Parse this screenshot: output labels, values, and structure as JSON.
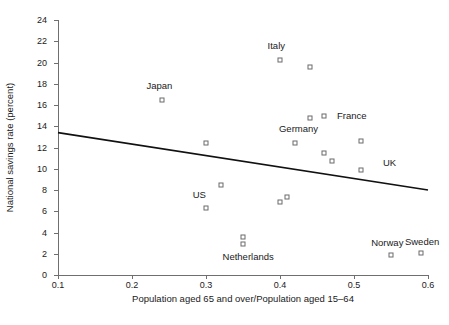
{
  "chart_data": {
    "type": "scatter",
    "title": "",
    "xlabel": "Population aged 65 and over/Population aged 15–64",
    "ylabel": "National savings rate (percent)",
    "xlim": [
      0.1,
      0.6
    ],
    "ylim": [
      0,
      24
    ],
    "xticks": [
      0.1,
      0.2,
      0.3,
      0.4,
      0.5,
      0.6
    ],
    "xtick_labels": [
      "0.1",
      "0.2",
      "0.3",
      "0.4",
      "0.5",
      "0.6"
    ],
    "yticks": [
      0,
      2,
      4,
      6,
      8,
      10,
      12,
      14,
      16,
      18,
      20,
      22,
      24
    ],
    "ytick_labels": [
      "0",
      "2",
      "4",
      "6",
      "8",
      "10",
      "12",
      "14",
      "16",
      "18",
      "20",
      "22",
      "24"
    ],
    "grid": false,
    "legend": "none",
    "marker_style": "open-square",
    "marker_color": "#6b6b6b",
    "points": [
      {
        "x": 0.24,
        "y": 16.5
      },
      {
        "x": 0.4,
        "y": 20.2
      },
      {
        "x": 0.44,
        "y": 19.6
      },
      {
        "x": 0.44,
        "y": 14.8
      },
      {
        "x": 0.46,
        "y": 15.0
      },
      {
        "x": 0.42,
        "y": 12.4
      },
      {
        "x": 0.51,
        "y": 12.6
      },
      {
        "x": 0.46,
        "y": 11.5
      },
      {
        "x": 0.47,
        "y": 10.7
      },
      {
        "x": 0.51,
        "y": 9.9
      },
      {
        "x": 0.3,
        "y": 12.4
      },
      {
        "x": 0.32,
        "y": 8.5
      },
      {
        "x": 0.3,
        "y": 6.3
      },
      {
        "x": 0.4,
        "y": 6.9
      },
      {
        "x": 0.41,
        "y": 7.3
      },
      {
        "x": 0.35,
        "y": 3.6
      },
      {
        "x": 0.35,
        "y": 2.9
      },
      {
        "x": 0.55,
        "y": 1.9
      },
      {
        "x": 0.59,
        "y": 2.1
      }
    ],
    "annotations": [
      {
        "text": "Italy",
        "x": 0.395,
        "y": 21.6
      },
      {
        "text": "Japan",
        "x": 0.237,
        "y": 17.8
      },
      {
        "text": "France",
        "x": 0.497,
        "y": 15.0
      },
      {
        "text": "Germany",
        "x": 0.425,
        "y": 13.7
      },
      {
        "text": "UK",
        "x": 0.548,
        "y": 10.5
      },
      {
        "text": "US",
        "x": 0.291,
        "y": 7.5
      },
      {
        "text": "Netherlands",
        "x": 0.357,
        "y": 1.7
      },
      {
        "text": "Norway",
        "x": 0.545,
        "y": 3.0
      },
      {
        "text": "Sweden",
        "x": 0.592,
        "y": 3.1
      }
    ],
    "trend_line": {
      "type": "linear-fit",
      "color": "#111111",
      "x_start": 0.1,
      "y_start": 13.4,
      "x_end": 0.6,
      "y_end": 8.0
    }
  }
}
